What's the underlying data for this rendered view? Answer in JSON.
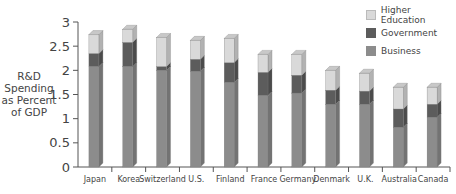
{
  "chart_data": {
    "type": "bar",
    "stacked": true,
    "title": "",
    "xlabel": "",
    "ylabel": "R&D Spending as Percent of GDP",
    "ylabel_lines": [
      "R&D",
      "Spending",
      "as Percent",
      "of GDP"
    ],
    "ylim": [
      0,
      3
    ],
    "yticks": [
      "0",
      "0.5",
      "1",
      "1.5",
      "2",
      "2.5",
      "3"
    ],
    "grid": false,
    "legend_position": "top-right",
    "categories": [
      "Japan",
      "Korea",
      "Switzerland",
      "U.S.",
      "Finland",
      "France",
      "Germany",
      "Denmark",
      "U.K.",
      "Australia",
      "Canada"
    ],
    "series": [
      {
        "name": "Business",
        "color": "#8c8c8c",
        "values": [
          2.08,
          2.08,
          2.0,
          1.98,
          1.75,
          1.48,
          1.53,
          1.3,
          1.3,
          0.82,
          1.03
        ]
      },
      {
        "name": "Government",
        "color": "#5c5c5c",
        "values": [
          0.27,
          0.5,
          0.08,
          0.25,
          0.41,
          0.48,
          0.37,
          0.29,
          0.27,
          0.38,
          0.27
        ]
      },
      {
        "name": "Higher Education",
        "color": "#d9d9d9",
        "values": [
          0.39,
          0.27,
          0.6,
          0.39,
          0.5,
          0.37,
          0.43,
          0.41,
          0.37,
          0.45,
          0.35
        ]
      }
    ]
  },
  "legend": {
    "items": [
      {
        "label": "Higher Education",
        "color": "#d9d9d9"
      },
      {
        "label": "Government",
        "color": "#5c5c5c"
      },
      {
        "label": "Business",
        "color": "#8c8c8c"
      }
    ]
  }
}
